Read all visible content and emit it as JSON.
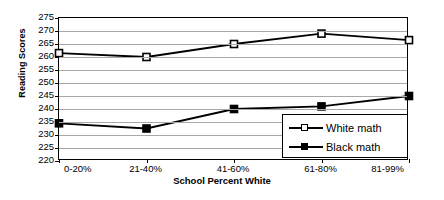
{
  "chart_data": {
    "type": "line",
    "title": "",
    "xlabel": "School Percent White",
    "ylabel": "Reading Scores",
    "categories": [
      "0-20%",
      "21-40%",
      "41-60%",
      "61-80%",
      "81-99%"
    ],
    "ylim": [
      220,
      275
    ],
    "ytick_step": 5,
    "yticks": [
      275,
      270,
      265,
      260,
      255,
      250,
      245,
      240,
      235,
      230,
      225,
      220
    ],
    "grid": true,
    "legend_position": "bottom-right",
    "series": [
      {
        "name": "White math",
        "marker": "open-square",
        "color": "#000000",
        "values": [
          261.5,
          260,
          265,
          269,
          266.5
        ]
      },
      {
        "name": "Black math",
        "marker": "filled-square",
        "color": "#000000",
        "values": [
          234.5,
          232.5,
          240,
          241,
          245
        ]
      }
    ]
  },
  "legend": {
    "items": [
      {
        "label": "White math",
        "marker": "open-square"
      },
      {
        "label": "Black math",
        "marker": "filled-square"
      }
    ]
  }
}
